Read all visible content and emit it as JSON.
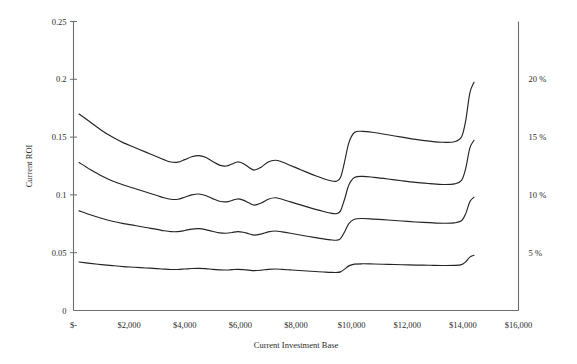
{
  "chart_data": {
    "type": "line",
    "title": "",
    "xlabel": "Current Investment Base",
    "ylabel": "Current ROI",
    "xlim": [
      0,
      16000
    ],
    "ylim": [
      0,
      0.25
    ],
    "grid": false,
    "legend": "none",
    "x_tick_labels": [
      "$-",
      "$2,000",
      "$4,000",
      "$6,000",
      "$8,000",
      "$10,000",
      "$12,000",
      "$14,000",
      "$16,000"
    ],
    "x_tick_values": [
      0,
      2000,
      4000,
      6000,
      8000,
      10000,
      12000,
      14000,
      16000
    ],
    "y_tick_labels": [
      "0",
      "0.05",
      "0.1",
      "0.15",
      "0.2",
      "0.25"
    ],
    "y_tick_values": [
      0,
      0.05,
      0.1,
      0.15,
      0.2,
      0.25
    ],
    "y2_tick_labels": [
      "5 %",
      "10 %",
      "15 %",
      "20 %"
    ],
    "y2_tick_values": [
      0.05,
      0.1,
      0.15,
      0.2
    ],
    "series": [
      {
        "name": "series-1",
        "x": [
          200,
          600,
          1000,
          1400,
          1800,
          2200,
          2600,
          3000,
          3250,
          3500,
          3750,
          4000,
          4250,
          4500,
          4750,
          5000,
          5250,
          5500,
          5700,
          5900,
          6100,
          6300,
          6500,
          6750,
          7000,
          7250,
          7500,
          7800,
          8100,
          8400,
          8700,
          9000,
          9250,
          9450,
          9600,
          9750,
          9900,
          10100,
          10400,
          10800,
          11300,
          11800,
          12300,
          12800,
          13300,
          13700,
          13950,
          14100,
          14250,
          14400
        ],
        "y": [
          0.17,
          0.163,
          0.156,
          0.15,
          0.145,
          0.141,
          0.137,
          0.133,
          0.1305,
          0.1285,
          0.1283,
          0.1305,
          0.133,
          0.134,
          0.1325,
          0.129,
          0.1258,
          0.125,
          0.1268,
          0.1285,
          0.1272,
          0.124,
          0.1215,
          0.124,
          0.1285,
          0.13,
          0.1285,
          0.1255,
          0.1225,
          0.1195,
          0.1165,
          0.114,
          0.1122,
          0.1118,
          0.115,
          0.129,
          0.145,
          0.154,
          0.155,
          0.154,
          0.152,
          0.15,
          0.148,
          0.1465,
          0.1455,
          0.146,
          0.15,
          0.164,
          0.188,
          0.1975
        ]
      },
      {
        "name": "series-2",
        "x": [
          200,
          600,
          1000,
          1400,
          1800,
          2200,
          2600,
          3000,
          3250,
          3500,
          3750,
          4000,
          4250,
          4500,
          4750,
          5000,
          5250,
          5500,
          5700,
          5900,
          6100,
          6300,
          6500,
          6750,
          7000,
          7250,
          7500,
          7800,
          8100,
          8400,
          8700,
          9000,
          9250,
          9450,
          9600,
          9750,
          9900,
          10100,
          10400,
          10800,
          11300,
          11800,
          12300,
          12800,
          13300,
          13700,
          13950,
          14100,
          14250,
          14400
        ],
        "y": [
          0.128,
          0.122,
          0.1165,
          0.112,
          0.1085,
          0.1055,
          0.1025,
          0.0995,
          0.0975,
          0.0962,
          0.0962,
          0.098,
          0.1,
          0.1008,
          0.0995,
          0.0968,
          0.0945,
          0.094,
          0.0952,
          0.0965,
          0.0955,
          0.0932,
          0.0912,
          0.093,
          0.0962,
          0.0975,
          0.0962,
          0.094,
          0.0918,
          0.0896,
          0.0875,
          0.0856,
          0.0842,
          0.0838,
          0.0862,
          0.0965,
          0.1085,
          0.115,
          0.116,
          0.1152,
          0.1138,
          0.1122,
          0.1108,
          0.1098,
          0.109,
          0.1095,
          0.1125,
          0.1228,
          0.1405,
          0.1472
        ]
      },
      {
        "name": "series-3",
        "x": [
          200,
          600,
          1000,
          1400,
          1800,
          2200,
          2600,
          3000,
          3250,
          3500,
          3750,
          4000,
          4250,
          4500,
          4750,
          5000,
          5250,
          5500,
          5700,
          5900,
          6100,
          6300,
          6500,
          6750,
          7000,
          7250,
          7500,
          7800,
          8100,
          8400,
          8700,
          9000,
          9250,
          9450,
          9600,
          9750,
          9900,
          10100,
          10400,
          10800,
          11300,
          11800,
          12300,
          12800,
          13300,
          13700,
          13950,
          14100,
          14250,
          14400
        ],
        "y": [
          0.0862,
          0.0828,
          0.0798,
          0.0772,
          0.0752,
          0.0735,
          0.0718,
          0.0702,
          0.069,
          0.0682,
          0.0682,
          0.0692,
          0.0704,
          0.0708,
          0.07,
          0.0685,
          0.0672,
          0.0668,
          0.0675,
          0.0682,
          0.0677,
          0.0664,
          0.0652,
          0.0662,
          0.068,
          0.0688,
          0.068,
          0.0668,
          0.0655,
          0.0642,
          0.063,
          0.0619,
          0.0611,
          0.0608,
          0.0622,
          0.0682,
          0.0752,
          0.079,
          0.0796,
          0.0791,
          0.0783,
          0.0774,
          0.0766,
          0.076,
          0.0755,
          0.0758,
          0.0776,
          0.0836,
          0.094,
          0.098
        ]
      },
      {
        "name": "series-4",
        "x": [
          200,
          600,
          1000,
          1400,
          1800,
          2200,
          2600,
          3000,
          3250,
          3500,
          3750,
          4000,
          4250,
          4500,
          4750,
          5000,
          5250,
          5500,
          5700,
          5900,
          6100,
          6300,
          6500,
          6750,
          7000,
          7250,
          7500,
          7800,
          8100,
          8400,
          8700,
          9000,
          9250,
          9450,
          9600,
          9750,
          9900,
          10100,
          10400,
          10800,
          11300,
          11800,
          12300,
          12800,
          13300,
          13700,
          13950,
          14100,
          14250,
          14400
        ],
        "y": [
          0.042,
          0.0408,
          0.0397,
          0.0388,
          0.038,
          0.0374,
          0.0368,
          0.0362,
          0.0358,
          0.0355,
          0.0355,
          0.0359,
          0.0363,
          0.0365,
          0.0362,
          0.0356,
          0.0352,
          0.035,
          0.0353,
          0.0356,
          0.0354,
          0.0349,
          0.0345,
          0.0349,
          0.0356,
          0.0359,
          0.0356,
          0.0351,
          0.0346,
          0.0342,
          0.0337,
          0.0333,
          0.033,
          0.0329,
          0.0334,
          0.0358,
          0.0386,
          0.0401,
          0.0404,
          0.0402,
          0.0399,
          0.0396,
          0.0393,
          0.0391,
          0.0389,
          0.039,
          0.0397,
          0.0421,
          0.0462,
          0.0478
        ]
      }
    ]
  },
  "colors": {
    "line": "#242424",
    "axis": "#6d6d6d",
    "text": "#2b2b2b",
    "background": "#ffffff"
  }
}
